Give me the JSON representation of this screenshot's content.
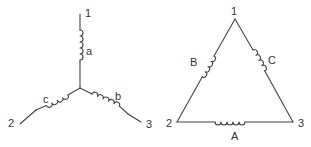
{
  "star": {
    "terminals": {
      "t1": "1",
      "t2": "2",
      "t3": "3"
    },
    "windings": {
      "a": "a",
      "b": "b",
      "c": "c"
    }
  },
  "delta": {
    "terminals": {
      "t1": "1",
      "t2": "2",
      "t3": "3"
    },
    "windings": {
      "A": "A",
      "B": "B",
      "C": "C"
    }
  },
  "colors": {
    "line": "#444444",
    "text": "#333333",
    "background": "#ffffff"
  }
}
